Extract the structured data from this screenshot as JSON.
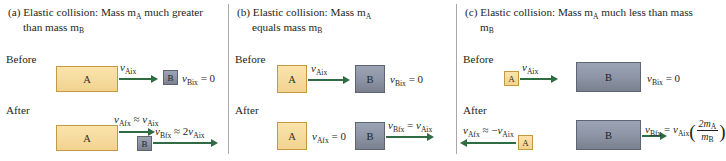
{
  "figure": {
    "caption_style": "three-panel physics diagram of elastic collisions",
    "arrow_color": "#2f6b43",
    "block_a_color": "#f6dca0",
    "block_b_color": "#8d95a6"
  },
  "stage_labels": {
    "before": "Before",
    "after": "After"
  },
  "panels": [
    {
      "id": "a",
      "title_line1": "(a) Elastic collision: Mass m",
      "title_sub1": "A",
      "title_line1b": " much greater",
      "title_line2": "than mass m",
      "title_sub2": "B",
      "before": {
        "block_a_label": "A",
        "block_b_label": "B",
        "v_a_symbol": "v",
        "v_a_sub": "Aix",
        "v_b_text": "v",
        "v_b_sub": "Bix",
        "v_b_value": " = 0"
      },
      "after": {
        "block_a_label": "A",
        "block_b_label": "B",
        "v_a_lhs_sub": "Afx",
        "v_a_rel": " ≈ ",
        "v_a_rhs_sub": "Aix",
        "v_b_lhs_sub": "Bfx",
        "v_b_rel": " ≈ 2",
        "v_b_rhs_sub": "Aix"
      }
    },
    {
      "id": "b",
      "title_line1": "(b) Elastic collision: Mass m",
      "title_sub1": "A",
      "title_line1b": "",
      "title_line2": "equals mass m",
      "title_sub2": "B",
      "before": {
        "block_a_label": "A",
        "block_b_label": "B",
        "v_a_symbol": "v",
        "v_a_sub": "Aix",
        "v_b_text": "v",
        "v_b_sub": "Bix",
        "v_b_value": " = 0"
      },
      "after": {
        "block_a_label": "A",
        "block_b_label": "B",
        "v_a_lhs_sub": "Afx",
        "v_a_rel": " = 0",
        "v_b_lhs_sub": "Bfx",
        "v_b_rel": " = ",
        "v_b_rhs_sub": "Aix"
      }
    },
    {
      "id": "c",
      "title_line1": "(c) Elastic collision: Mass m",
      "title_sub1": "A",
      "title_line1b": " much less than mass m",
      "title_sub2": "B",
      "title_line2": "",
      "before": {
        "block_a_label": "A",
        "block_b_label": "B",
        "v_a_symbol": "v",
        "v_a_sub": "Aix",
        "v_b_text": "v",
        "v_b_sub": "Bix",
        "v_b_value": " = 0"
      },
      "after": {
        "block_a_label": "A",
        "block_b_label": "B",
        "v_a_lhs_sub": "Afx",
        "v_a_rel": " ≈ −",
        "v_a_rhs_sub": "Aix",
        "v_b_lhs_sub": "Bfx",
        "v_b_rel": " = ",
        "v_b_rhs_sub": "Aix",
        "frac_num": "2m",
        "frac_num_sub": "A",
        "frac_den": "m",
        "frac_den_sub": "B"
      }
    }
  ]
}
